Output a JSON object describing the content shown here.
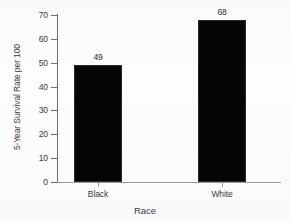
{
  "chart_data": {
    "type": "bar",
    "title": "",
    "subtitle": "",
    "xlabel": "Race",
    "ylabel": "5-Year Survival Rate per 100",
    "categories": [
      "Black",
      "White"
    ],
    "values": [
      49,
      68
    ],
    "data_labels": [
      "49",
      "68"
    ],
    "ylim": [
      0,
      70
    ],
    "ytick_values": [
      0,
      10,
      20,
      30,
      40,
      50,
      60,
      70
    ],
    "ytick_labels": [
      "0",
      "10",
      "20",
      "30",
      "40",
      "50",
      "60",
      "70"
    ],
    "grid": false,
    "legend": null,
    "legend_position": "none",
    "bar_color": "#050505",
    "axis_color": "#6e6e6e",
    "text_color": "#3b3b3b",
    "background_color": "#fdfdfd",
    "annotations": []
  }
}
